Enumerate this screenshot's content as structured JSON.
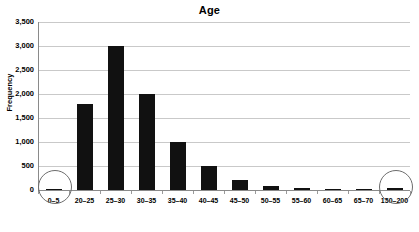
{
  "chart_data": {
    "type": "bar",
    "title": "Age",
    "xlabel": "",
    "ylabel": "Frequency",
    "categories": [
      "0–5",
      "20–25",
      "25–30",
      "30–35",
      "35–40",
      "40–45",
      "45–50",
      "50–55",
      "55–60",
      "60–65",
      "65–70",
      "150–200"
    ],
    "values": [
      30,
      1800,
      3000,
      2000,
      1000,
      500,
      200,
      90,
      40,
      15,
      8,
      50
    ],
    "ylim": [
      0,
      3500
    ],
    "ytick_labels": [
      "0",
      "500",
      "1,000",
      "1,500",
      "2,000",
      "2,500",
      "3,000",
      "3,500"
    ],
    "ytick_values": [
      0,
      500,
      1000,
      1500,
      2000,
      2500,
      3000,
      3500
    ],
    "grid": "horizontal",
    "legend": null,
    "bar_color": "#111111",
    "gridline_color": "#c9c9c9",
    "axis_color": "#8a8a8a",
    "annotations": [
      {
        "name": "outlier-circle-low",
        "category": "0–5",
        "shape": "circle"
      },
      {
        "name": "outlier-circle-high",
        "category": "150–200",
        "shape": "circle"
      }
    ]
  }
}
